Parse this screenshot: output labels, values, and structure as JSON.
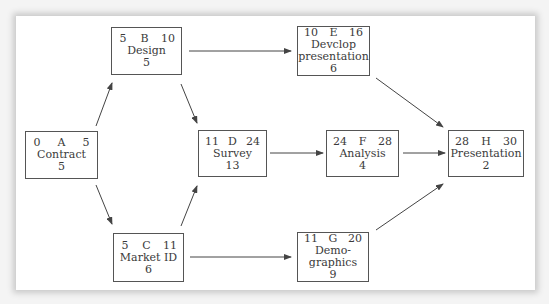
{
  "diagram": {
    "type": "activity-on-node network",
    "nodes": [
      {
        "id": "A",
        "es": "0",
        "ef": "5",
        "name": "Contract",
        "duration": "5"
      },
      {
        "id": "B",
        "es": "5",
        "ef": "10",
        "name": "Design",
        "duration": "5"
      },
      {
        "id": "C",
        "es": "5",
        "ef": "11",
        "name": "Market ID",
        "duration": "6"
      },
      {
        "id": "D",
        "es": "11",
        "ef": "24",
        "name": "Survey",
        "duration": "13"
      },
      {
        "id": "E",
        "es": "10",
        "ef": "16",
        "name": "Devclop presentation",
        "duration": "6"
      },
      {
        "id": "F",
        "es": "24",
        "ef": "28",
        "name": "Analysis",
        "duration": "4"
      },
      {
        "id": "G",
        "es": "11",
        "ef": "20",
        "name": "Demo-graphics",
        "duration": "9"
      },
      {
        "id": "H",
        "es": "28",
        "ef": "30",
        "name": "Presentation",
        "duration": "2"
      }
    ],
    "edges": [
      [
        "A",
        "B"
      ],
      [
        "A",
        "C"
      ],
      [
        "B",
        "D"
      ],
      [
        "C",
        "D"
      ],
      [
        "B",
        "E"
      ],
      [
        "D",
        "F"
      ],
      [
        "C",
        "G"
      ],
      [
        "E",
        "H"
      ],
      [
        "F",
        "H"
      ],
      [
        "G",
        "H"
      ]
    ]
  },
  "nodes": {
    "A": {
      "es": "0",
      "id": "A",
      "ef": "5",
      "line1": "Contract",
      "line2": "",
      "dur": "5"
    },
    "B": {
      "es": "5",
      "id": "B",
      "ef": "10",
      "line1": "Design",
      "line2": "",
      "dur": "5"
    },
    "C": {
      "es": "5",
      "id": "C",
      "ef": "11",
      "line1": "Market ID",
      "line2": "",
      "dur": "6"
    },
    "D": {
      "es": "11",
      "id": "D",
      "ef": "24",
      "line1": "Survey",
      "line2": "",
      "dur": "13"
    },
    "E": {
      "es": "10",
      "id": "E",
      "ef": "16",
      "line1": "Devclop",
      "line2": "presentation",
      "dur": "6"
    },
    "F": {
      "es": "24",
      "id": "F",
      "ef": "28",
      "line1": "Analysis",
      "line2": "",
      "dur": "4"
    },
    "G": {
      "es": "11",
      "id": "G",
      "ef": "20",
      "line1": "Demo-",
      "line2": "graphics",
      "dur": "9"
    },
    "H": {
      "es": "28",
      "id": "H",
      "ef": "30",
      "line1": "Presentation",
      "line2": "",
      "dur": "2"
    }
  },
  "colors": {
    "line": "#444444",
    "text": "#3a3a3a",
    "panel": "#ffffff",
    "shadow": "#c9c9c9"
  }
}
